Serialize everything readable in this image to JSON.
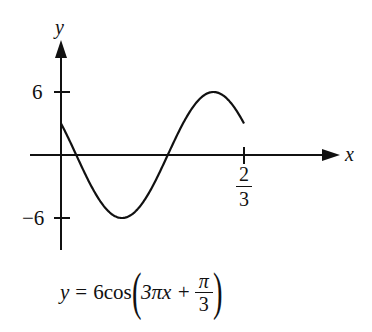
{
  "chart_data": {
    "type": "line",
    "title": "",
    "equation": "y = 6cos(3πx + π/3)",
    "formula_parts": {
      "lhs": "y",
      "equals": "=",
      "coef_fn": "6cos",
      "arg_main": "3πx +",
      "frac_num": "π",
      "frac_den": "3"
    },
    "xlabel": "x",
    "ylabel": "y",
    "xlim": [
      0,
      0.6667
    ],
    "ylim": [
      -6,
      6
    ],
    "x_ticks": [
      {
        "value": 0.6667,
        "label_num": "2",
        "label_den": "3"
      }
    ],
    "y_ticks": [
      {
        "value": 6,
        "label": "6"
      },
      {
        "value": -6,
        "label": "−6"
      }
    ],
    "grid": false,
    "series": [
      {
        "name": "y = 6cos(3πx + π/3)",
        "x": [
          0,
          0.0556,
          0.1111,
          0.1667,
          0.2222,
          0.2778,
          0.3333,
          0.3889,
          0.4444,
          0.5,
          0.5556,
          0.6111,
          0.6667
        ],
        "values": [
          3,
          0,
          -3,
          -5.2,
          -6,
          -5.2,
          -3,
          0,
          3,
          5.2,
          6,
          5.2,
          3
        ]
      }
    ],
    "color": "#111111"
  }
}
